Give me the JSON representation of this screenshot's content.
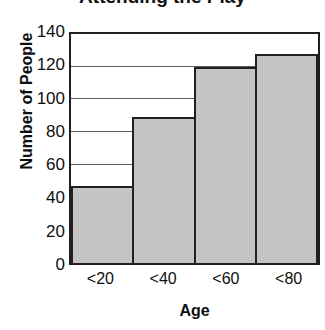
{
  "chart_data": {
    "type": "bar",
    "title": "Attending the Play",
    "xlabel": "Age",
    "ylabel": "Number of People",
    "categories": [
      "<20",
      "<40",
      "<60",
      "<80"
    ],
    "values": [
      47,
      89,
      120,
      128
    ],
    "ylim": [
      0,
      140
    ],
    "ytick_labels": [
      "0",
      "20",
      "40",
      "60",
      "80",
      "100",
      "120",
      "140"
    ],
    "ytick_values": [
      0,
      20,
      40,
      60,
      80,
      100,
      120,
      140
    ],
    "grid": true,
    "grid_axis": "y",
    "legend": "none",
    "bar_fill_color": "#c4c4c4",
    "bar_edge_color": "#231f20",
    "background_color": "#ffffff",
    "bar_gap": 0
  }
}
